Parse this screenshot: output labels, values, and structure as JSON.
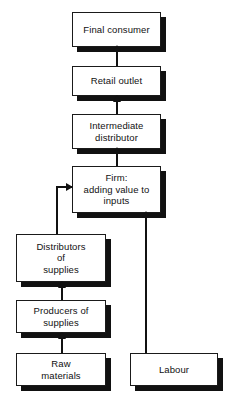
{
  "diagram": {
    "type": "flowchart",
    "orientation": "bottom-up",
    "colors": {
      "box_fill": "#ffffff",
      "box_border": "#1a1a1a",
      "shadow": "#111111",
      "arrow": "#111111",
      "background": "#ffffff"
    },
    "nodes": [
      {
        "id": "final-consumer",
        "label": "Final consumer",
        "x": 72,
        "y": 12,
        "w": 89,
        "h": 35
      },
      {
        "id": "retail-outlet",
        "label": "Retail outlet",
        "x": 72,
        "y": 66,
        "w": 89,
        "h": 30
      },
      {
        "id": "intermediate-distributor",
        "label": "Intermediate\ndistributor",
        "x": 72,
        "y": 114,
        "w": 89,
        "h": 35
      },
      {
        "id": "firm",
        "label": "Firm:\nadding value to\ninputs",
        "x": 72,
        "y": 166,
        "w": 89,
        "h": 47
      },
      {
        "id": "distributors-of-supplies",
        "label": "Distributors\nof\nsupplies",
        "x": 16,
        "y": 234,
        "w": 90,
        "h": 48
      },
      {
        "id": "producers-of-supplies",
        "label": "Producers of\nsupplies",
        "x": 16,
        "y": 300,
        "w": 90,
        "h": 33
      },
      {
        "id": "raw-materials",
        "label": "Raw\nmaterials",
        "x": 16,
        "y": 353,
        "w": 90,
        "h": 33
      },
      {
        "id": "labour",
        "label": "Labour",
        "x": 130,
        "y": 353,
        "w": 88,
        "h": 33
      }
    ],
    "edges": [
      {
        "id": "retail-to-consumer",
        "from": "retail-outlet",
        "to": "final-consumer",
        "style": "straight-up"
      },
      {
        "id": "intermediate-to-retail",
        "from": "intermediate-distributor",
        "to": "retail-outlet",
        "style": "straight-up"
      },
      {
        "id": "firm-to-intermediate",
        "from": "firm",
        "to": "intermediate-distributor",
        "style": "straight-up"
      },
      {
        "id": "distributors-to-firm",
        "from": "distributors-of-supplies",
        "to": "firm",
        "style": "elbow-right"
      },
      {
        "id": "producers-to-distributors",
        "from": "producers-of-supplies",
        "to": "distributors-of-supplies",
        "style": "straight-up"
      },
      {
        "id": "raw-to-producers",
        "from": "raw-materials",
        "to": "producers-of-supplies",
        "style": "straight-up"
      },
      {
        "id": "labour-to-firm",
        "from": "labour",
        "to": "firm",
        "style": "straight-up"
      }
    ]
  }
}
